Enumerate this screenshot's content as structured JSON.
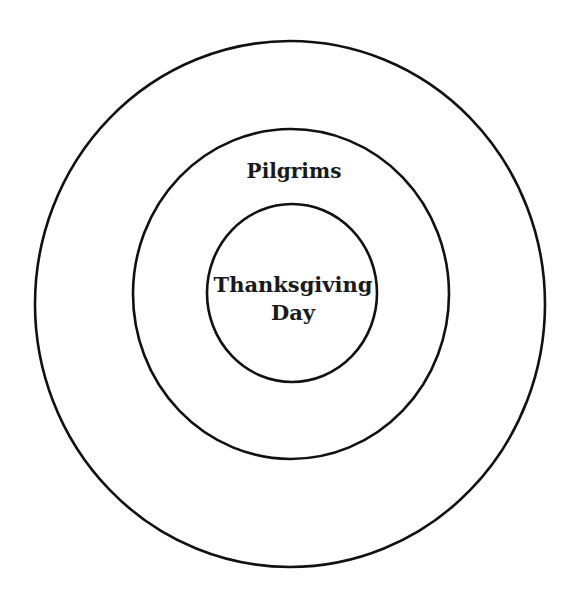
{
  "diagram": {
    "type": "concentric-circles",
    "stroke_color": "#111111",
    "background": "#ffffff",
    "rings": [
      {
        "id": "outer",
        "label": ""
      },
      {
        "id": "middle",
        "label": "Pilgrims"
      },
      {
        "id": "inner",
        "label_line1": "Thanksgiving",
        "label_line2": "Day"
      }
    ]
  }
}
